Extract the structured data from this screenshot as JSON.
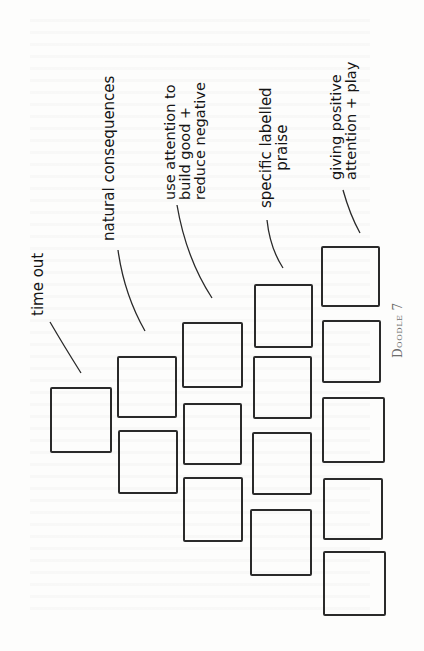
{
  "doodle": {
    "caption": "Doodle 7",
    "labels": {
      "time_out": [
        "time out"
      ],
      "natural_consequences": [
        "natural consequences"
      ],
      "use_attention": [
        "use attention to",
        "build good +",
        "reduce negative"
      ],
      "specific_praise": [
        "specific labelled",
        "praise"
      ],
      "giving_positive": [
        "giving positive",
        "attention + play"
      ]
    },
    "columns": [
      {
        "label": "time out",
        "box_count": 1
      },
      {
        "label": "natural consequences",
        "box_count": 2
      },
      {
        "label": "use attention to build good + reduce negative",
        "box_count": 3
      },
      {
        "label": "specific labelled praise",
        "box_count": 4
      },
      {
        "label": "giving positive attention + play",
        "box_count": 5
      }
    ],
    "stroke_color": "#2a2a2a",
    "caption_color": "#6d6d6d"
  }
}
